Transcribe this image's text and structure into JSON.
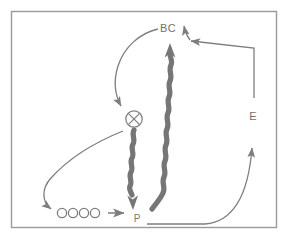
{
  "figure": {
    "background_color": "#ffffff",
    "border_color": "#9a9a9a",
    "stroke_color": "#7d7d7d",
    "thick_arrow_color": "#767676",
    "label_color": "#6f6f6f",
    "border": {
      "x": 11,
      "y": 11,
      "width": 266,
      "height": 217
    }
  },
  "labels": {
    "bc": "BC",
    "e": "E",
    "p": "P"
  },
  "nodes": [
    {
      "id": "bc",
      "name": "node-bc",
      "label": "BC",
      "x": 168,
      "y": 28,
      "kind": "text-node"
    },
    {
      "id": "e",
      "name": "node-e",
      "label": "E",
      "x": 253,
      "y": 116,
      "kind": "text-node"
    },
    {
      "id": "p",
      "name": "node-p",
      "label": "P",
      "x": 139,
      "y": 219,
      "kind": "text-node"
    },
    {
      "id": "x",
      "name": "node-crossed-circle",
      "label": "",
      "x": 134,
      "y": 119,
      "kind": "crossed-circle-icon"
    }
  ],
  "circle_group": {
    "name": "circle-chain",
    "count": 4,
    "cx_start": 62,
    "cy": 213,
    "spacing": 11,
    "radius": 4.6
  },
  "edges": [
    {
      "id": "bc-to-x",
      "name": "edge-bc-to-crossed-circle",
      "style": "thin-curve",
      "from": "bc",
      "to": "x"
    },
    {
      "id": "p-to-bc",
      "name": "edge-p-to-bc",
      "style": "thick-wavy",
      "from": "p",
      "to": "bc"
    },
    {
      "id": "x-to-p",
      "name": "edge-crossed-circle-to-p",
      "style": "thick-wavy",
      "from": "x",
      "to": "p"
    },
    {
      "id": "e-to-bc",
      "name": "edge-e-to-bc",
      "style": "thin-elbow",
      "from": "e",
      "to": "bc"
    },
    {
      "id": "p-to-e",
      "name": "edge-p-to-e",
      "style": "thin-curve",
      "from": "p",
      "to": "e"
    },
    {
      "id": "x-to-circles",
      "name": "edge-crossed-circle-to-circle-chain",
      "style": "thin-curve",
      "from": "x",
      "to": "circle-chain"
    },
    {
      "id": "circles-to-p",
      "name": "edge-circle-chain-to-p",
      "style": "thin-short-arrow",
      "from": "circle-chain",
      "to": "p"
    }
  ],
  "chart_data": {
    "type": "diagram",
    "nodes": [
      "BC",
      "E",
      "P",
      "crossed-circle",
      "circle-chain (4 circles)"
    ],
    "edges": [
      {
        "from": "BC",
        "to": "crossed-circle",
        "style": "thin curved arrow"
      },
      {
        "from": "crossed-circle",
        "to": "P",
        "style": "thick wavy arrow (downward)"
      },
      {
        "from": "P",
        "to": "BC",
        "style": "thick wavy arrow (upward)"
      },
      {
        "from": "E",
        "to": "BC",
        "style": "thin elbow arrow"
      },
      {
        "from": "P",
        "to": "E",
        "style": "thin curved arrow"
      },
      {
        "from": "crossed-circle",
        "to": "circle-chain",
        "style": "thin curved arrow"
      },
      {
        "from": "circle-chain",
        "to": "P",
        "style": "thin short arrow"
      }
    ]
  }
}
